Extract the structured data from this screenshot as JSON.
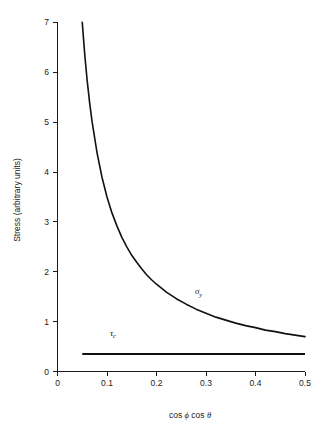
{
  "chart_data": {
    "type": "line",
    "title": "",
    "xlabel": "cos ϕ cos θ",
    "ylabel": "Stress (arbitrary units)",
    "xlim": [
      0,
      0.5
    ],
    "ylim": [
      0,
      7
    ],
    "grid": false,
    "legend_position": "inline-annotation",
    "x_ticks": [
      "0",
      "0.1",
      "0.2",
      "0.3",
      "0.4",
      "0.5"
    ],
    "x_tick_values": [
      0,
      0.1,
      0.2,
      0.3,
      0.4,
      0.5
    ],
    "y_ticks": [
      "0",
      "1",
      "2",
      "3",
      "4",
      "5",
      "6",
      "7"
    ],
    "y_tick_values": [
      0,
      1,
      2,
      3,
      4,
      5,
      6,
      7
    ],
    "series": [
      {
        "name": "σy",
        "label_symbol": "σ",
        "label_subscript": "y",
        "annotation_x": 0.285,
        "annotation_y": 1.55,
        "relation": "sigma_y = tau_c / (cos phi cos theta)",
        "x": [
          0.05,
          0.055,
          0.06,
          0.065,
          0.07,
          0.08,
          0.09,
          0.1,
          0.11,
          0.12,
          0.13,
          0.14,
          0.15,
          0.16,
          0.17,
          0.18,
          0.19,
          0.2,
          0.22,
          0.24,
          0.26,
          0.28,
          0.3,
          0.32,
          0.34,
          0.36,
          0.38,
          0.4,
          0.42,
          0.44,
          0.46,
          0.48,
          0.5
        ],
        "y": [
          7.0,
          6.36,
          5.83,
          5.38,
          5.0,
          4.38,
          3.89,
          3.5,
          3.18,
          2.92,
          2.69,
          2.5,
          2.33,
          2.19,
          2.06,
          1.94,
          1.84,
          1.75,
          1.59,
          1.46,
          1.35,
          1.25,
          1.17,
          1.09,
          1.03,
          0.97,
          0.92,
          0.88,
          0.83,
          0.8,
          0.76,
          0.73,
          0.7
        ]
      },
      {
        "name": "τc",
        "label_symbol": "τ",
        "label_subscript": "c",
        "annotation_x": 0.112,
        "annotation_y": 0.72,
        "constant_value": 0.35,
        "x": [
          0.05,
          0.5
        ],
        "y": [
          0.35,
          0.35
        ]
      }
    ]
  }
}
